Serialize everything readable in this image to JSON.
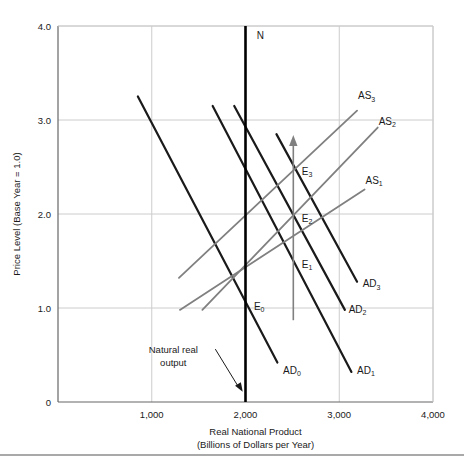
{
  "chart_data": {
    "type": "line",
    "title": "",
    "xlabel": "Real National Product (Billions of Dollars per Year)",
    "xlabel_line1": "Real National Product",
    "xlabel_line2": "(Billions of Dollars per Year)",
    "ylabel": "Price Level (Base Year = 1.0)",
    "xlim": [
      0,
      4000
    ],
    "ylim": [
      0,
      4.0
    ],
    "grid": true,
    "legend_position": "inline-curve-labels",
    "xticks": [
      {
        "value": 1000,
        "label": "1,000"
      },
      {
        "value": 2000,
        "label": "2,000"
      },
      {
        "value": 3000,
        "label": "3,000"
      },
      {
        "value": 4000,
        "label": "4,000"
      }
    ],
    "yticks": [
      {
        "value": 0,
        "label": "0"
      },
      {
        "value": 1.0,
        "label": "1.0"
      },
      {
        "value": 2.0,
        "label": "2.0"
      },
      {
        "value": 3.0,
        "label": "3.0"
      },
      {
        "value": 4.0,
        "label": "4.0"
      }
    ],
    "colors": {
      "aggregate_demand": "#1a1a1a",
      "aggregate_supply": "#808080",
      "natural_output_line": "#000000",
      "arrow": "#808080",
      "grid": "#cccccc",
      "axis": "#666666",
      "background": "#ffffff"
    },
    "series": [
      {
        "name": "AD0",
        "label": "AD",
        "sub": "0",
        "kind": "aggregate-demand",
        "color": "#1a1a1a",
        "x": [
          852,
          2340
        ],
        "y": [
          3.25,
          0.42
        ],
        "label_x": 2400,
        "label_y": 0.3
      },
      {
        "name": "AD1",
        "label": "AD",
        "sub": "1",
        "kind": "aggregate-demand",
        "color": "#1a1a1a",
        "x": [
          1650,
          3130
        ],
        "y": [
          3.15,
          0.32
        ],
        "label_x": 3190,
        "label_y": 0.3
      },
      {
        "name": "AD2",
        "label": "AD",
        "sub": "2",
        "kind": "aggregate-demand",
        "color": "#1a1a1a",
        "x": [
          1880,
          3060
        ],
        "y": [
          3.15,
          0.98
        ],
        "label_x": 3100,
        "label_y": 0.95
      },
      {
        "name": "AD3",
        "label": "AD",
        "sub": "3",
        "kind": "aggregate-demand",
        "color": "#1a1a1a",
        "x": [
          2330,
          3190
        ],
        "y": [
          2.85,
          1.28
        ],
        "label_x": 3250,
        "label_y": 1.22
      },
      {
        "name": "AS1",
        "label": "AS",
        "sub": "1",
        "kind": "aggregate-supply",
        "color": "#808080",
        "x": [
          1300,
          3270
        ],
        "y": [
          0.98,
          2.26
        ],
        "label_x": 3280,
        "label_y": 2.32
      },
      {
        "name": "AS2",
        "label": "AS",
        "sub": "2",
        "kind": "aggregate-supply",
        "color": "#808080",
        "x": [
          1540,
          3410
        ],
        "y": [
          0.98,
          2.92
        ],
        "label_x": 3420,
        "label_y": 2.95
      },
      {
        "name": "AS3",
        "label": "AS",
        "sub": "3",
        "kind": "aggregate-supply",
        "color": "#808080",
        "x": [
          1290,
          3190
        ],
        "y": [
          1.32,
          3.1
        ],
        "label_x": 3200,
        "label_y": 3.22
      }
    ],
    "equilibria": [
      {
        "name": "E0",
        "label": "E",
        "sub": "0",
        "x": 2000,
        "y": 1.0,
        "label_x": 2090,
        "label_y": 0.98
      },
      {
        "name": "E1",
        "label": "E",
        "sub": "1",
        "x": 2510,
        "y": 1.45,
        "label_x": 2600,
        "label_y": 1.43
      },
      {
        "name": "E2",
        "label": "E",
        "sub": "2",
        "x": 2510,
        "y": 1.93,
        "label_x": 2600,
        "label_y": 1.92
      },
      {
        "name": "E3",
        "label": "E",
        "sub": "3",
        "x": 2510,
        "y": 2.43,
        "label_x": 2600,
        "label_y": 2.42
      }
    ],
    "vertical_lines": [
      {
        "name": "natural-real-output",
        "label": "N",
        "x": 2000,
        "y_from": 0,
        "y_to": 4.0,
        "label_x": 2120,
        "label_y": 3.86,
        "color": "#000000",
        "width": 2.6
      }
    ],
    "arrows": [
      {
        "name": "adjustment-arrow",
        "x": 2510,
        "y_from": 0.87,
        "y_to": 2.82,
        "color": "#808080"
      }
    ],
    "annotations": [
      {
        "name": "natural-real-output-note",
        "line1": "Natural real",
        "line2": "output",
        "x": 1230,
        "y": 0.52,
        "arrow_to_x": 1970,
        "arrow_to_y": 0.11
      }
    ]
  }
}
